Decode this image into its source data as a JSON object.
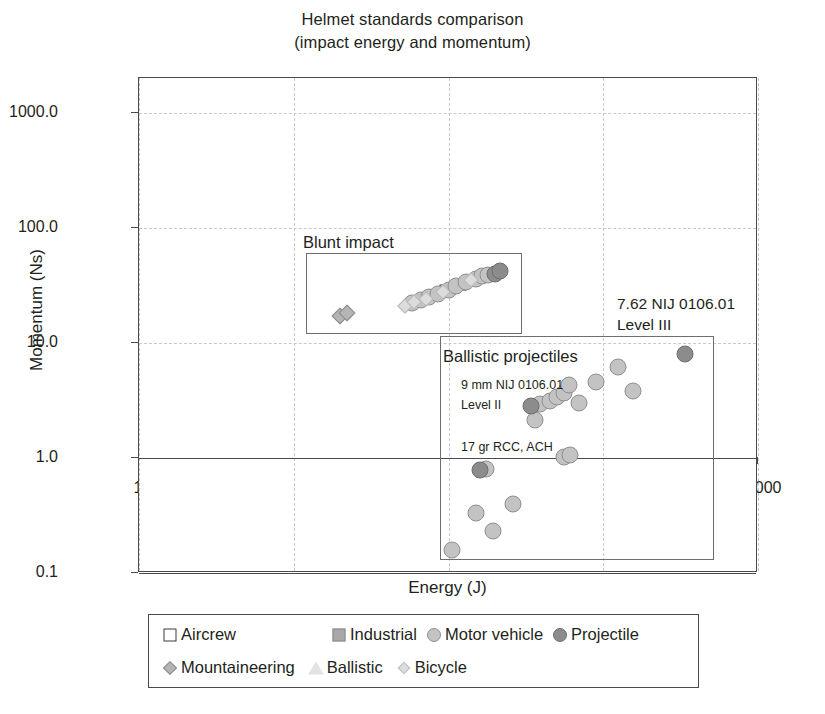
{
  "chart_data": {
    "type": "scatter",
    "title": "Helmet standards comparison",
    "subtitle": "(impact energy and momentum)",
    "xlabel": "Energy (J)",
    "ylabel": "Momentum (Ns)",
    "xscale": "log",
    "yscale": "log",
    "xlim": [
      1,
      10000
    ],
    "ylim": [
      0.1,
      2000
    ],
    "grid": "dashed-both",
    "xticks": [
      "1",
      "10",
      "100",
      "1,000",
      "10,000"
    ],
    "xtick_values": [
      1,
      10,
      100,
      1000,
      10000
    ],
    "yticks": [
      "0.1",
      "1.0",
      "10.0",
      "100.0",
      "1000.0"
    ],
    "ytick_values": [
      0.1,
      1,
      10,
      100,
      1000
    ],
    "legend_position": "below-plot",
    "series": [
      {
        "name": "Aircrew",
        "marker": "open-square",
        "color": "#ffffff",
        "edge": "#3b3b3b",
        "points": [
          {
            "x": 80,
            "y": 26
          },
          {
            "x": 95,
            "y": 29
          },
          {
            "x": 120,
            "y": 32
          }
        ]
      },
      {
        "name": "Industrial",
        "marker": "filled-square",
        "color": "#a8a8a8",
        "points": [
          {
            "x": 62,
            "y": 23
          },
          {
            "x": 70,
            "y": 24.5
          },
          {
            "x": 88,
            "y": 27
          }
        ]
      },
      {
        "name": "Motor vehicle",
        "marker": "light-circle",
        "color": "#c3c3c3",
        "points": [
          {
            "x": 58,
            "y": 22
          },
          {
            "x": 66,
            "y": 23.5
          },
          {
            "x": 75,
            "y": 25
          },
          {
            "x": 85,
            "y": 26.5
          },
          {
            "x": 100,
            "y": 29
          },
          {
            "x": 112,
            "y": 31
          },
          {
            "x": 130,
            "y": 34
          },
          {
            "x": 150,
            "y": 36
          },
          {
            "x": 165,
            "y": 38
          },
          {
            "x": 180,
            "y": 39
          },
          {
            "x": 105,
            "y": 0.16
          },
          {
            "x": 150,
            "y": 0.33
          },
          {
            "x": 195,
            "y": 0.23
          },
          {
            "x": 260,
            "y": 0.4
          },
          {
            "x": 175,
            "y": 0.8
          },
          {
            "x": 560,
            "y": 1.02
          },
          {
            "x": 610,
            "y": 1.05
          },
          {
            "x": 360,
            "y": 2.15
          },
          {
            "x": 390,
            "y": 2.95
          },
          {
            "x": 450,
            "y": 3.15
          },
          {
            "x": 500,
            "y": 3.35
          },
          {
            "x": 560,
            "y": 3.7
          },
          {
            "x": 600,
            "y": 4.3
          },
          {
            "x": 700,
            "y": 3.0
          },
          {
            "x": 900,
            "y": 4.6
          },
          {
            "x": 1250,
            "y": 6.2
          },
          {
            "x": 1550,
            "y": 3.8
          }
        ]
      },
      {
        "name": "Projectile",
        "marker": "gray-circle",
        "color": "#8c8c8c",
        "points": [
          {
            "x": 200,
            "y": 40
          },
          {
            "x": 215,
            "y": 42
          },
          {
            "x": 340,
            "y": 2.85
          },
          {
            "x": 160,
            "y": 0.78
          },
          {
            "x": 3400,
            "y": 8.0
          }
        ]
      },
      {
        "name": "Mountaineering",
        "marker": "gray-diamond",
        "color": "#b5b5b5",
        "points": [
          {
            "x": 20,
            "y": 17
          },
          {
            "x": 22,
            "y": 18
          }
        ]
      },
      {
        "name": "Ballistic",
        "marker": "open-triangle",
        "color": "#e3e3e3",
        "points": [
          {
            "x": 19,
            "y": 16
          },
          {
            "x": 45,
            "y": 20.5
          }
        ]
      },
      {
        "name": "Bicycle",
        "marker": "light-diamond",
        "color": "#dcdcdc",
        "points": [
          {
            "x": 52,
            "y": 21
          },
          {
            "x": 60,
            "y": 22.5
          },
          {
            "x": 72,
            "y": 24
          },
          {
            "x": 92,
            "y": 27.5
          },
          {
            "x": 140,
            "y": 35
          }
        ]
      }
    ],
    "regions": [
      {
        "name": "blunt-impact",
        "label": "Blunt impact",
        "x0": 12,
        "x1": 300,
        "y0": 12,
        "y1": 60
      },
      {
        "name": "ballistic-projectiles",
        "label": "Ballistic projectiles",
        "x0": 88,
        "x1": 5200,
        "y0": 0.13,
        "y1": 11.5
      }
    ],
    "annotations": [
      {
        "name": "nij-level-3",
        "lines": [
          "7.62 NIJ 0106.01",
          "Level III"
        ]
      },
      {
        "name": "nij-level-2",
        "lines": [
          "9 mm NIJ 0106.01",
          "Level II"
        ]
      },
      {
        "name": "rcc-ach",
        "lines": [
          "17 gr RCC, ACH"
        ]
      }
    ]
  },
  "title": {
    "line1": "Helmet standards comparison",
    "line2": "(impact energy and momentum)"
  },
  "axes": {
    "x_label": "Energy (J)",
    "y_label": "Momentum (Ns)",
    "x_ticks": [
      "1",
      "10",
      "100",
      "1,000",
      "10,000"
    ],
    "y_ticks": [
      "1000.0",
      "100.0",
      "10.0",
      "1.0",
      "0.1"
    ]
  },
  "regions": {
    "blunt_impact_label": "Blunt impact",
    "ballistic_label": "Ballistic projectiles"
  },
  "annotations": {
    "level3_line1": "7.62 NIJ 0106.01",
    "level3_line2": "Level III",
    "level2_line1": "9 mm NIJ 0106.01",
    "level2_line2": "Level II",
    "rcc_ach": "17 gr RCC, ACH"
  },
  "legend": {
    "row1": [
      {
        "label": "Aircrew",
        "marker": "open-square-icon"
      },
      {
        "label": "Industrial",
        "marker": "filled-square-icon"
      },
      {
        "label": "Motor vehicle",
        "marker": "light-circle-icon"
      },
      {
        "label": "Projectile",
        "marker": "gray-circle-icon"
      }
    ],
    "row2": [
      {
        "label": "Mountaineering",
        "marker": "gray-diamond-icon"
      },
      {
        "label": "Ballistic",
        "marker": "open-triangle-icon"
      },
      {
        "label": "Bicycle",
        "marker": "light-diamond-icon"
      }
    ]
  },
  "colors": {
    "projectile": "#8c8c8c",
    "motor_vehicle": "#c3c3c3",
    "industrial": "#a8a8a8",
    "mountaineering": "#b5b5b5",
    "bicycle": "#dcdcdc",
    "ballistic": "#e3e3e3",
    "aircrew": "#ffffff",
    "frame": "#4a4a4a",
    "grid": "#c9c9c9",
    "text": "#231f20"
  }
}
